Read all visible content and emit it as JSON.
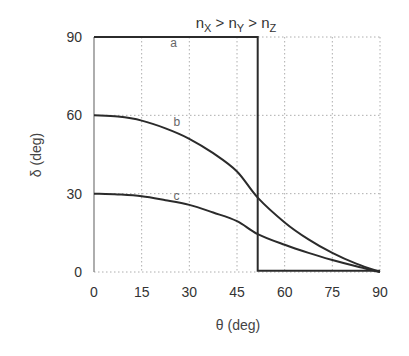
{
  "chart_data": {
    "type": "line",
    "title_parts": {
      "n1": "n",
      "s1": "X",
      "gt1": " > ",
      "n2": "n",
      "s2": "Y",
      "gt2": " > ",
      "n3": "n",
      "s3": "Z"
    },
    "xlabel": "θ (deg)",
    "ylabel": "δ (deg)",
    "xlim": [
      0,
      90
    ],
    "ylim": [
      0,
      90
    ],
    "xticks": [
      0,
      15,
      30,
      45,
      60,
      75,
      90
    ],
    "yticks": [
      0,
      30,
      60,
      90
    ],
    "xtick_labels": [
      "0",
      "15",
      "30",
      "45",
      "60",
      "75",
      "90"
    ],
    "ytick_labels": [
      "0",
      "30",
      "60",
      "90"
    ],
    "grid": true,
    "legend": "none (inline curve labels a, b, c)",
    "series": [
      {
        "name": "a",
        "label_pos": {
          "x": 24,
          "y": 86
        },
        "x": [
          0,
          51.5,
          51.5,
          90
        ],
        "y": [
          90,
          90,
          0.5,
          0.5
        ]
      },
      {
        "name": "b",
        "label_pos": {
          "x": 25,
          "y": 56
        },
        "x": [
          0,
          7.5,
          15,
          22.5,
          30,
          37.5,
          45,
          51.5,
          60,
          67.5,
          75,
          82.5,
          90
        ],
        "y": [
          60,
          59.5,
          58,
          55,
          51,
          45.5,
          38.5,
          28.5,
          19,
          12.5,
          7.3,
          3.2,
          0
        ]
      },
      {
        "name": "c",
        "label_pos": {
          "x": 25,
          "y": 27.5
        },
        "x": [
          0,
          7.5,
          15,
          22.5,
          30,
          37.5,
          45,
          51.5,
          60,
          67.5,
          75,
          82.5,
          90
        ],
        "y": [
          30,
          29.7,
          29,
          27.5,
          25.7,
          22.8,
          19.5,
          14.5,
          10.4,
          7.3,
          4.6,
          2.2,
          0
        ]
      }
    ]
  },
  "labels": {
    "title_n": "n",
    "title_x": "X",
    "title_y": "Y",
    "title_z": "Z",
    "title_gt": " > ",
    "xlabel": "θ (deg)",
    "ylabel": "δ (deg)",
    "curve_a": "a",
    "curve_b": "b",
    "curve_c": "c"
  },
  "ticks": {
    "x": [
      "0",
      "15",
      "30",
      "45",
      "60",
      "75",
      "90"
    ],
    "y": [
      "0",
      "30",
      "60",
      "90"
    ]
  }
}
